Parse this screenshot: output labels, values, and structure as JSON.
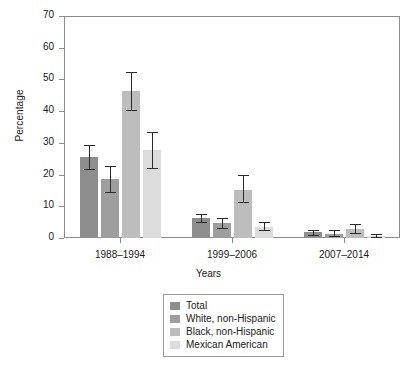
{
  "chart_data": {
    "type": "bar",
    "title": "",
    "xlabel": "Years",
    "ylabel": "Percentage",
    "ylim": [
      0,
      70
    ],
    "yticks": [
      0,
      10,
      20,
      30,
      40,
      50,
      60,
      70
    ],
    "grid": false,
    "legend_position": "bottom-center",
    "categories": [
      "1988–1994",
      "1999–2006",
      "2007–2014"
    ],
    "series": [
      {
        "name": "Total",
        "color": "#8d8d8d",
        "values": [
          25.7,
          6.3,
          1.8
        ],
        "err_low": [
          21.6,
          5.2,
          1.1
        ],
        "err_high": [
          29.4,
          7.6,
          2.6
        ]
      },
      {
        "name": "White, non-Hispanic",
        "color": "#9e9e9e",
        "values": [
          18.7,
          4.7,
          1.3
        ],
        "err_low": [
          14.6,
          3.2,
          0.5
        ],
        "err_high": [
          22.7,
          6.4,
          2.5
        ]
      },
      {
        "name": "Black, non-Hispanic",
        "color": "#bdbdbd",
        "values": [
          46.3,
          15.2,
          2.9
        ],
        "err_low": [
          40.4,
          11.4,
          1.6
        ],
        "err_high": [
          52.3,
          19.8,
          4.4
        ]
      },
      {
        "name": "Mexican American",
        "color": "#dcdcdc",
        "values": [
          27.8,
          3.6,
          0.6
        ],
        "err_low": [
          22.2,
          2.4,
          0.2
        ],
        "err_high": [
          33.3,
          5.1,
          1.4
        ]
      }
    ]
  },
  "axes": {
    "y_title": "Percentage",
    "x_title": "Years"
  },
  "legend": {
    "items": [
      {
        "label": "Total",
        "color": "#8d8d8d"
      },
      {
        "label": "White, non-Hispanic",
        "color": "#9e9e9e"
      },
      {
        "label": "Black, non-Hispanic",
        "color": "#bdbdbd"
      },
      {
        "label": "Mexican American",
        "color": "#dcdcdc"
      }
    ]
  },
  "colors": {
    "axis": "#8c8c8c",
    "error_bar": "#2a2a2a",
    "text": "#1a1a1a"
  }
}
